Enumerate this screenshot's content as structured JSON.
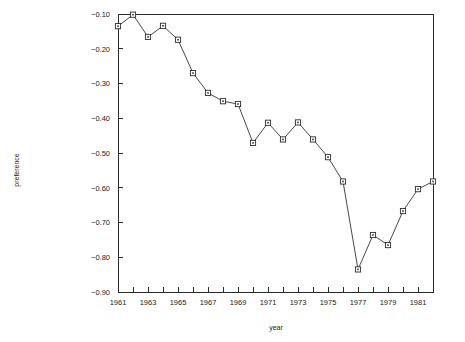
{
  "chart_data": {
    "type": "line",
    "title": "",
    "xlabel": "year",
    "ylabel": "preference",
    "x": [
      1961,
      1962,
      1963,
      1964,
      1965,
      1966,
      1967,
      1968,
      1969,
      1970,
      1971,
      1972,
      1973,
      1974,
      1975,
      1976,
      1977,
      1978,
      1979,
      1980,
      1981,
      1982
    ],
    "values": [
      -0.135,
      -0.102,
      -0.166,
      -0.134,
      -0.174,
      -0.27,
      -0.327,
      -0.351,
      -0.359,
      -0.471,
      -0.413,
      -0.461,
      -0.412,
      -0.461,
      -0.512,
      -0.582,
      -0.835,
      -0.736,
      -0.765,
      -0.667,
      -0.604,
      -0.582
    ],
    "series": [
      {
        "name": "preference",
        "values": [
          -0.135,
          -0.102,
          -0.166,
          -0.134,
          -0.174,
          -0.27,
          -0.327,
          -0.351,
          -0.359,
          -0.471,
          -0.413,
          -0.461,
          -0.412,
          -0.461,
          -0.512,
          -0.582,
          -0.835,
          -0.736,
          -0.765,
          -0.667,
          -0.604,
          -0.582
        ]
      }
    ],
    "xlim": [
      1961,
      1982
    ],
    "ylim": [
      -0.9,
      -0.1
    ],
    "xticks": [
      1961,
      1962,
      1963,
      1964,
      1965,
      1966,
      1967,
      1968,
      1969,
      1970,
      1971,
      1972,
      1973,
      1974,
      1975,
      1976,
      1977,
      1978,
      1979,
      1980,
      1981,
      1982
    ],
    "xtick_labels": [
      "1961",
      "",
      "1963",
      "",
      "1965",
      "",
      "1967",
      "",
      "1969",
      "",
      "1971",
      "",
      "1973",
      "",
      "1975",
      "",
      "1977",
      "",
      "1979",
      "",
      "1981",
      ""
    ],
    "yticks": [
      -0.1,
      -0.2,
      -0.3,
      -0.4,
      -0.5,
      -0.6,
      -0.7,
      -0.8,
      -0.9
    ],
    "ytick_labels": [
      "−0.10",
      "−0.20",
      "−0.30",
      "−0.40",
      "−0.50",
      "−0.60",
      "−0.70",
      "−0.80",
      "−0.90"
    ],
    "grid": false,
    "legend": null,
    "marker": "open-square",
    "line_color": "#333333",
    "marker_face_color": "#ffffff",
    "marker_edge_color": "#2b2b2b"
  }
}
